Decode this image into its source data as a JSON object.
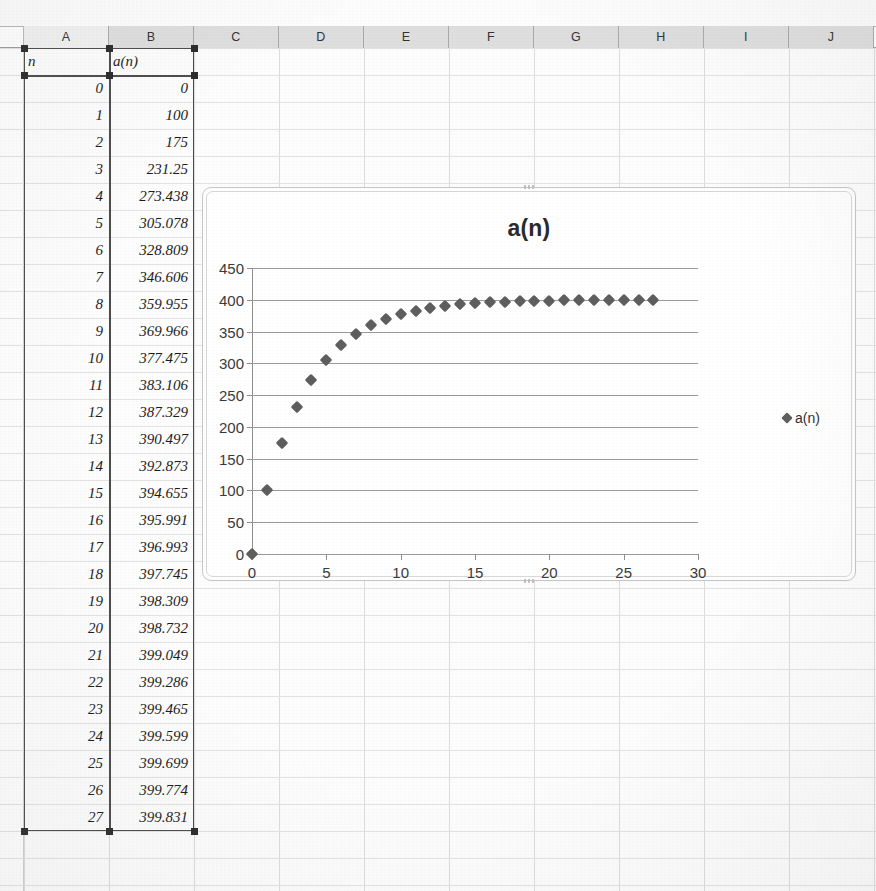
{
  "spreadsheet": {
    "column_headers": [
      "A",
      "B",
      "C",
      "D",
      "E",
      "F",
      "G",
      "H",
      "I",
      "J"
    ],
    "selected_column": "A",
    "headers_row": {
      "a": "n",
      "b": "a(n)"
    },
    "rows": [
      {
        "n": "0",
        "a": "0"
      },
      {
        "n": "1",
        "a": "100"
      },
      {
        "n": "2",
        "a": "175"
      },
      {
        "n": "3",
        "a": "231.25"
      },
      {
        "n": "4",
        "a": "273.438"
      },
      {
        "n": "5",
        "a": "305.078"
      },
      {
        "n": "6",
        "a": "328.809"
      },
      {
        "n": "7",
        "a": "346.606"
      },
      {
        "n": "8",
        "a": "359.955"
      },
      {
        "n": "9",
        "a": "369.966"
      },
      {
        "n": "10",
        "a": "377.475"
      },
      {
        "n": "11",
        "a": "383.106"
      },
      {
        "n": "12",
        "a": "387.329"
      },
      {
        "n": "13",
        "a": "390.497"
      },
      {
        "n": "14",
        "a": "392.873"
      },
      {
        "n": "15",
        "a": "394.655"
      },
      {
        "n": "16",
        "a": "395.991"
      },
      {
        "n": "17",
        "a": "396.993"
      },
      {
        "n": "18",
        "a": "397.745"
      },
      {
        "n": "19",
        "a": "398.309"
      },
      {
        "n": "20",
        "a": "398.732"
      },
      {
        "n": "21",
        "a": "399.049"
      },
      {
        "n": "22",
        "a": "399.286"
      },
      {
        "n": "23",
        "a": "399.465"
      },
      {
        "n": "24",
        "a": "399.599"
      },
      {
        "n": "25",
        "a": "399.699"
      },
      {
        "n": "26",
        "a": "399.774"
      },
      {
        "n": "27",
        "a": "399.831"
      }
    ]
  },
  "chart_data": {
    "type": "scatter",
    "title": "a(n)",
    "xlabel": "",
    "ylabel": "",
    "xlim": [
      0,
      30
    ],
    "ylim": [
      0,
      450
    ],
    "xticks": [
      "0",
      "5",
      "10",
      "15",
      "20",
      "25",
      "30"
    ],
    "yticks": [
      "0",
      "50",
      "100",
      "150",
      "200",
      "250",
      "300",
      "350",
      "400",
      "450"
    ],
    "grid": "horizontal",
    "legend_position": "right",
    "marker": "diamond",
    "marker_color": "#5e5e5e",
    "series": [
      {
        "name": "a(n)",
        "x": [
          0,
          1,
          2,
          3,
          4,
          5,
          6,
          7,
          8,
          9,
          10,
          11,
          12,
          13,
          14,
          15,
          16,
          17,
          18,
          19,
          20,
          21,
          22,
          23,
          24,
          25,
          26,
          27
        ],
        "values": [
          0,
          100,
          175,
          231.25,
          273.438,
          305.078,
          328.809,
          346.606,
          359.955,
          369.966,
          377.475,
          383.106,
          387.329,
          390.497,
          392.873,
          394.655,
          395.991,
          396.993,
          397.745,
          398.309,
          398.732,
          399.049,
          399.286,
          399.465,
          399.599,
          399.699,
          399.774,
          399.831
        ]
      }
    ]
  }
}
